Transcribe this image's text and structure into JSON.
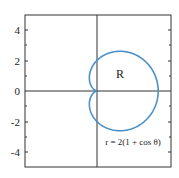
{
  "chart_data": {
    "type": "line",
    "subtype": "polar-curve",
    "title": "",
    "xlabel": "",
    "ylabel": "",
    "xlim": [
      -4.7,
      4.8
    ],
    "ylim": [
      -5,
      5
    ],
    "grid": false,
    "yticks": [
      4,
      2,
      0,
      -2,
      -4
    ],
    "ytick_labels": [
      "4",
      "2",
      "0",
      "-2",
      "-4"
    ],
    "xticks": [],
    "series": [
      {
        "name": "r = 2(1 + cos θ)",
        "equation": "r = 2(1 + cos θ)",
        "color": "#4a90c8",
        "points_xy": [
          [
            4,
            0
          ],
          [
            3.7,
            1.5
          ],
          [
            3.0,
            2.6
          ],
          [
            2.0,
            3.2
          ],
          [
            1.0,
            3.3
          ],
          [
            0,
            2.0
          ],
          [
            -0.25,
            0.9
          ],
          [
            0,
            0
          ],
          [
            -0.25,
            -0.9
          ],
          [
            0,
            -2.0
          ],
          [
            1.0,
            -3.3
          ],
          [
            2.0,
            -3.2
          ],
          [
            3.0,
            -2.6
          ],
          [
            3.7,
            -1.5
          ],
          [
            4,
            0
          ]
        ]
      }
    ],
    "annotations": [
      {
        "text": "R",
        "x": 1.8,
        "y": 1.5
      },
      {
        "text": "r = 2(1 + cos θ)",
        "x": 2.4,
        "y": -3.6
      }
    ],
    "legend": null
  },
  "labels": {
    "region": "R",
    "equation": "r = 2(1 + cos θ)",
    "y_tick_4": "4",
    "y_tick_2": "2",
    "y_tick_0": "0",
    "y_tick_m2": "-2",
    "y_tick_m4": "-4"
  },
  "colors": {
    "curve": "#4a90c8",
    "axes": "#333333"
  }
}
